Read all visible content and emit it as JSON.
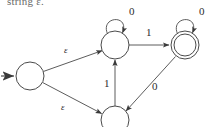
{
  "caption": {
    "text": "string ε."
  },
  "diagram": {
    "type": "finite-automaton",
    "states": [
      {
        "id": "q0",
        "name": "start-state",
        "cx": 30,
        "cy": 76,
        "r": 14,
        "accepting": false,
        "is_start": true,
        "label": ""
      },
      {
        "id": "q1",
        "name": "upper-state",
        "cx": 115,
        "cy": 45,
        "r": 14,
        "accepting": false,
        "is_start": false,
        "label": ""
      },
      {
        "id": "q2",
        "name": "accepting-state",
        "cx": 185,
        "cy": 45,
        "r": 14,
        "accepting": true,
        "is_start": false,
        "label": ""
      },
      {
        "id": "q3",
        "name": "lower-state",
        "cx": 115,
        "cy": 120,
        "r": 14,
        "accepting": false,
        "is_start": false,
        "label": ""
      }
    ],
    "transitions": [
      {
        "id": "t-start",
        "name": "start-arrow",
        "from": "",
        "to": "q0",
        "label": ""
      },
      {
        "id": "t-eps-upper",
        "name": "epsilon-transition-upper",
        "from": "q0",
        "to": "q1",
        "label": "ε"
      },
      {
        "id": "t-eps-lower",
        "name": "epsilon-transition-lower",
        "from": "q0",
        "to": "q3",
        "label": "ε"
      },
      {
        "id": "t-loop-upper",
        "name": "self-loop-upper-state",
        "from": "q1",
        "to": "q1",
        "label": "0"
      },
      {
        "id": "t-one-right",
        "name": "transition-upper-to-accepting",
        "from": "q1",
        "to": "q2",
        "label": "1"
      },
      {
        "id": "t-loop-accepting",
        "name": "self-loop-accepting-state",
        "from": "q2",
        "to": "q2",
        "label": "0"
      },
      {
        "id": "t-zero-diag",
        "name": "transition-accepting-to-lower",
        "from": "q2",
        "to": "q3",
        "label": "0"
      },
      {
        "id": "t-one-up",
        "name": "transition-lower-to-upper",
        "from": "q3",
        "to": "q1",
        "label": "1"
      },
      {
        "id": "t-loop-lower",
        "name": "self-loop-lower-state",
        "from": "q3",
        "to": "q3",
        "label": ""
      }
    ],
    "labels": {
      "loop_upper_zero": "0",
      "loop_accepting_zero": "0",
      "edge_one_right": "1",
      "edge_one_up": "1",
      "edge_zero_diag": "0",
      "epsilon_upper": "ε",
      "epsilon_lower": "ε"
    },
    "colors": {
      "stroke": "#4a4a4a",
      "text": "#2b2b2b",
      "background": "#ffffff"
    }
  }
}
